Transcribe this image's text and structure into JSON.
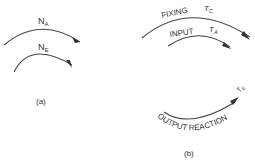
{
  "panel_a": {
    "caption": "(a)",
    "arrows": [
      {
        "label": "N",
        "subscript": "A"
      },
      {
        "label": "N",
        "subscript": "E"
      }
    ]
  },
  "panel_b": {
    "caption": "(b)",
    "arrows": [
      {
        "label": "FIXING",
        "torque": "T",
        "torque_subscript": "C"
      },
      {
        "label": "INPUT",
        "torque": "T",
        "torque_subscript": "A"
      },
      {
        "label": "OUTPUT  REACTION",
        "torque": "T",
        "torque_subscript": "E"
      }
    ]
  }
}
